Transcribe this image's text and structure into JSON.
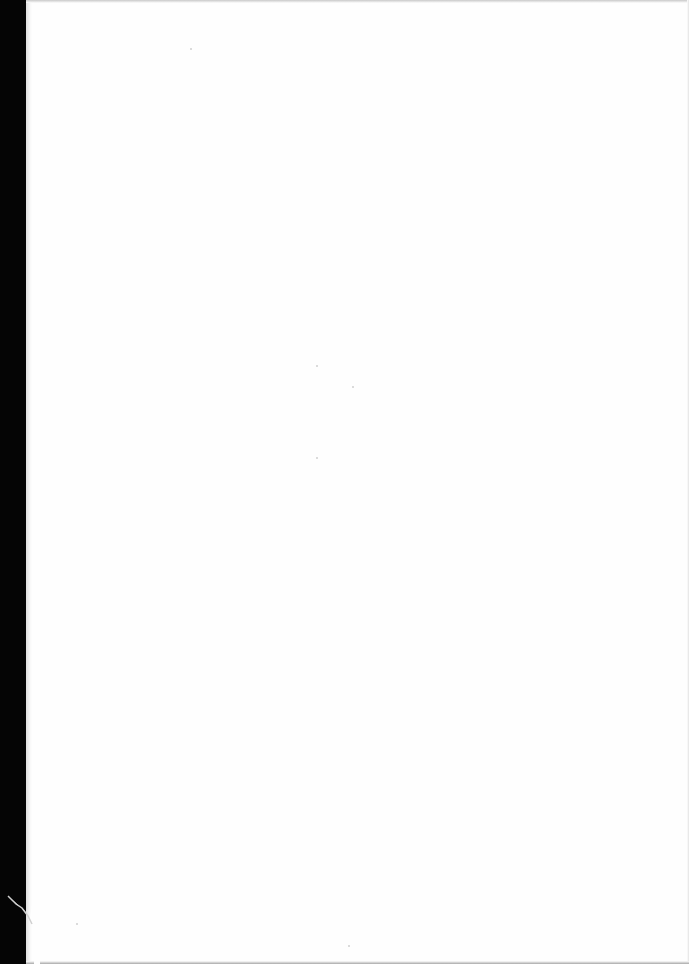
{
  "document": {
    "type": "scanned-page",
    "content": "blank",
    "colors": {
      "page": "#fefefe",
      "background": "#000000",
      "edge_shadow": "#c9c9c9"
    }
  }
}
